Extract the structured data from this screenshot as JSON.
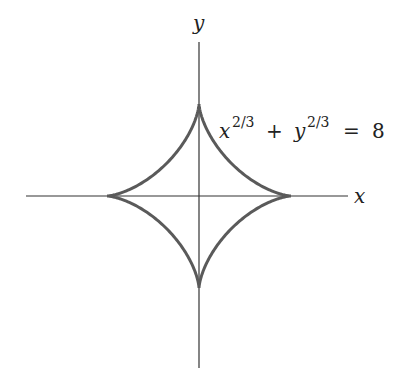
{
  "diagram": {
    "x_axis_label": "x",
    "y_axis_label": "y",
    "equation": {
      "x_var": "x",
      "x_exp": "2/3",
      "plus": "+",
      "y_var": "y",
      "y_exp": "2/3",
      "equals": "=",
      "rhs": "8"
    },
    "colors": {
      "axis": "#333333",
      "curve": "#5a5a5a",
      "background": "#ffffff"
    }
  }
}
